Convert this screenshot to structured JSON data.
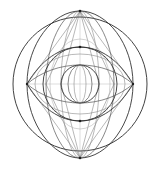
{
  "figure": {
    "background_color": "#ffffff",
    "line_color": "#333333",
    "accent_line_color": "#8a8a8a",
    "canvas": {
      "width": 160,
      "height": 169
    }
  },
  "chart_data": {
    "type": "diagram",
    "center": {
      "x": 80,
      "y": 84
    },
    "nodes": [
      {
        "name": "top-vertex",
        "x": 80,
        "y": 11
      },
      {
        "name": "bottom-vertex",
        "x": 80,
        "y": 158
      },
      {
        "name": "left-vertex",
        "x": 27,
        "y": 84
      },
      {
        "name": "right-vertex",
        "x": 133,
        "y": 84
      },
      {
        "name": "upper-node",
        "x": 80,
        "y": 47
      },
      {
        "name": "lower-node",
        "x": 80,
        "y": 121
      },
      {
        "name": "center-node",
        "x": 80,
        "y": 84
      }
    ],
    "circles": [
      {
        "name": "outer-circle",
        "cx": 80,
        "cy": 84,
        "r": 67
      },
      {
        "name": "upper-circle",
        "cx": 80,
        "cy": 84,
        "r": 37
      },
      {
        "name": "core-sphere",
        "cx": 80,
        "cy": 84,
        "r": 19
      }
    ],
    "ellipses": [
      {
        "name": "vertical-lens-outer",
        "rx": 53,
        "ry": 73.5,
        "note": "vertical vesica spanning top to bottom vertex"
      },
      {
        "name": "vertical-lens-mid",
        "rx": 34,
        "ry": 73.5
      },
      {
        "name": "vertical-lens-inner",
        "rx": 19,
        "ry": 73.5
      },
      {
        "name": "horizontal-eye-outer",
        "rx": 53,
        "ry": 37,
        "note": "wide eye lens, left to right vertex"
      },
      {
        "name": "horizontal-eye-mid",
        "rx": 53,
        "ry": 19
      },
      {
        "name": "meridian-wide",
        "rx": 19,
        "ry": 19
      },
      {
        "name": "meridian-mid",
        "rx": 12,
        "ry": 19
      },
      {
        "name": "meridian-narrow",
        "rx": 6,
        "ry": 19
      }
    ],
    "axes": [
      {
        "name": "horizontal-axis",
        "x1": 27,
        "y1": 84,
        "x2": 133,
        "y2": 84
      },
      {
        "name": "vertical-axis",
        "x1": 80,
        "y1": 11,
        "x2": 80,
        "y2": 158
      }
    ],
    "chord_count": 8,
    "symmetry": "bilateral + vertical mirror",
    "grid": false,
    "legend": false,
    "xlabel": "",
    "ylabel": ""
  }
}
